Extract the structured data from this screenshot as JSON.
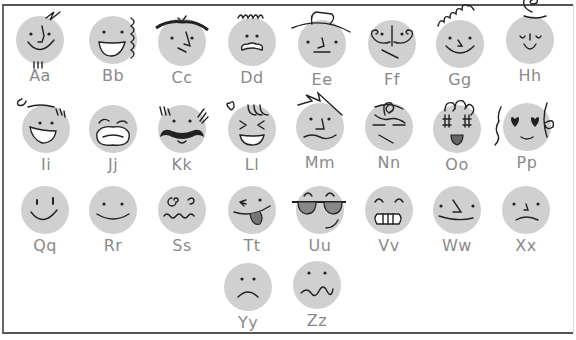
{
  "colors": {
    "face_fill": "#d0d0d0",
    "ink": "#222222",
    "label": "#8a8a8a",
    "frame": "#555555"
  },
  "faces": [
    {
      "label": "Aa",
      "x": 40,
      "y": 40,
      "expr": "smirk-hair-squiggle"
    },
    {
      "label": "Bb",
      "x": 113,
      "y": 40,
      "expr": "big-smile-curls"
    },
    {
      "label": "Cc",
      "x": 182,
      "y": 42,
      "expr": "skeptical-hair-part"
    },
    {
      "label": "Dd",
      "x": 252,
      "y": 42,
      "expr": "grimace-curly"
    },
    {
      "label": "Ee",
      "x": 322,
      "y": 44,
      "expr": "neutral-hat"
    },
    {
      "label": "Ff",
      "x": 392,
      "y": 44,
      "expr": "curled-mustache"
    },
    {
      "label": "Gg",
      "x": 460,
      "y": 44,
      "expr": "smile-curly-hair"
    },
    {
      "label": "Hh",
      "x": 530,
      "y": 40,
      "expr": "sleepy-swirl"
    },
    {
      "label": "Ii",
      "x": 46,
      "y": 129,
      "expr": "laughing"
    },
    {
      "label": "Jj",
      "x": 113,
      "y": 129,
      "expr": "crying"
    },
    {
      "label": "Kk",
      "x": 182,
      "y": 129,
      "expr": "mustache"
    },
    {
      "label": "Ll",
      "x": 252,
      "y": 129,
      "expr": "squint-laugh"
    },
    {
      "label": "Mm",
      "x": 320,
      "y": 127,
      "expr": "worried-spiky"
    },
    {
      "label": "Nn",
      "x": 389,
      "y": 127,
      "expr": "tired-messy"
    },
    {
      "label": "Oo",
      "x": 457,
      "y": 129,
      "expr": "starry-eyes"
    },
    {
      "label": "Pp",
      "x": 527,
      "y": 127,
      "expr": "heart-eyes"
    },
    {
      "label": "Qq",
      "x": 45,
      "y": 210,
      "expr": "grin"
    },
    {
      "label": "Rr",
      "x": 113,
      "y": 210,
      "expr": "smile"
    },
    {
      "label": "Ss",
      "x": 182,
      "y": 210,
      "expr": "dizzy"
    },
    {
      "label": "Tt",
      "x": 252,
      "y": 210,
      "expr": "tongue-wink"
    },
    {
      "label": "Uu",
      "x": 320,
      "y": 210,
      "expr": "sunglasses"
    },
    {
      "label": "Vv",
      "x": 389,
      "y": 210,
      "expr": "teeth-grin"
    },
    {
      "label": "Ww",
      "x": 457,
      "y": 210,
      "expr": "smug"
    },
    {
      "label": "Xx",
      "x": 526,
      "y": 210,
      "expr": "sad"
    },
    {
      "label": "Yy",
      "x": 248,
      "y": 287,
      "expr": "frown"
    },
    {
      "label": "Zz",
      "x": 317,
      "y": 285,
      "expr": "wavy-mouth"
    }
  ]
}
